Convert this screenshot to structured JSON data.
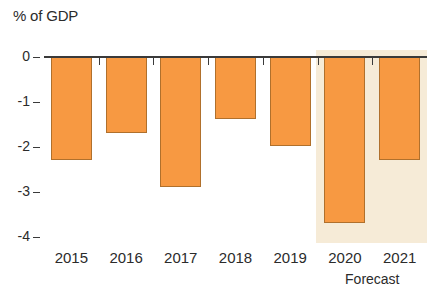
{
  "chart_data": {
    "type": "bar",
    "title": "% of GDP",
    "subtitle": "",
    "xlabel": "",
    "ylabel": "% of GDP",
    "categories": [
      "2015",
      "2016",
      "2017",
      "2018",
      "2019",
      "2020",
      "2021"
    ],
    "values": [
      -2.3,
      -1.7,
      -2.9,
      -1.4,
      -2.0,
      -3.7,
      -2.3
    ],
    "series": [
      {
        "name": "Budget balance",
        "values": [
          -2.3,
          -1.7,
          -2.9,
          -1.4,
          -2.0,
          -3.7,
          -2.3
        ]
      }
    ],
    "ylim": [
      -4.4,
      0
    ],
    "ytick_labels": [
      "0",
      "-1",
      "-2",
      "-3",
      "-4"
    ],
    "ytick_values": [
      0,
      -1,
      -2,
      -3,
      -4
    ],
    "grid": false,
    "legend": null,
    "bar_color": "#f79942",
    "bar_border_color": "#b0702c",
    "axis_color": "#3a3a3a",
    "background_color": "#ffffff",
    "annotations": [
      {
        "text": "Forecast",
        "covers_categories": [
          "2020",
          "2021"
        ],
        "band_color": "#f6ead5"
      }
    ]
  },
  "labels": {
    "title": "% of GDP",
    "forecast": "Forecast"
  }
}
